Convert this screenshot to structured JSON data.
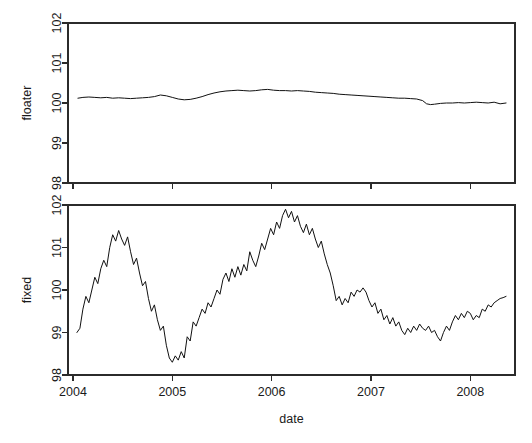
{
  "figure": {
    "width": 532,
    "height": 443,
    "background": "#ffffff",
    "line_color": "#111111",
    "axis_color": "#2b2b2b"
  },
  "chart_data": [
    {
      "type": "line",
      "title": "",
      "panel": "top",
      "xlabel": "",
      "ylabel": "floater",
      "xlim": [
        2003.95,
        2008.45
      ],
      "ylim": [
        98,
        102
      ],
      "xticks": [
        2004,
        2005,
        2006,
        2007,
        2008
      ],
      "xticklabels": [
        "2004",
        "2005",
        "2006",
        "2007",
        "2008"
      ],
      "yticks": [
        98,
        99,
        100,
        101,
        102
      ],
      "yticklabels": [
        "98",
        "99",
        "100",
        "101",
        "102"
      ],
      "grid": false,
      "legend": null,
      "series": [
        {
          "name": "floater",
          "x": [
            2004.05,
            2004.1,
            2004.16,
            2004.22,
            2004.28,
            2004.34,
            2004.4,
            2004.46,
            2004.52,
            2004.58,
            2004.64,
            2004.7,
            2004.76,
            2004.82,
            2004.88,
            2004.94,
            2005.0,
            2005.06,
            2005.12,
            2005.18,
            2005.24,
            2005.3,
            2005.36,
            2005.42,
            2005.48,
            2005.54,
            2005.6,
            2005.66,
            2005.72,
            2005.78,
            2005.84,
            2005.9,
            2005.96,
            2006.02,
            2006.08,
            2006.14,
            2006.2,
            2006.26,
            2006.32,
            2006.38,
            2006.44,
            2006.5,
            2006.56,
            2006.62,
            2006.68,
            2006.74,
            2006.8,
            2006.86,
            2006.92,
            2006.98,
            2007.04,
            2007.1,
            2007.16,
            2007.22,
            2007.28,
            2007.34,
            2007.4,
            2007.46,
            2007.52,
            2007.56,
            2007.6,
            2007.64,
            2007.7,
            2007.76,
            2007.82,
            2007.88,
            2007.94,
            2008.0,
            2008.06,
            2008.12,
            2008.18,
            2008.24,
            2008.3,
            2008.36
          ],
          "y": [
            100.12,
            100.14,
            100.15,
            100.14,
            100.13,
            100.14,
            100.12,
            100.13,
            100.12,
            100.11,
            100.12,
            100.13,
            100.14,
            100.16,
            100.2,
            100.18,
            100.14,
            100.1,
            100.08,
            100.09,
            100.12,
            100.16,
            100.21,
            100.25,
            100.28,
            100.3,
            100.31,
            100.32,
            100.31,
            100.3,
            100.31,
            100.33,
            100.34,
            100.32,
            100.31,
            100.31,
            100.3,
            100.31,
            100.3,
            100.29,
            100.27,
            100.26,
            100.25,
            100.24,
            100.22,
            100.21,
            100.2,
            100.19,
            100.18,
            100.17,
            100.16,
            100.15,
            100.14,
            100.13,
            100.12,
            100.12,
            100.11,
            100.1,
            100.06,
            99.98,
            99.96,
            99.97,
            99.99,
            100.0,
            100.0,
            100.01,
            100.0,
            100.01,
            100.02,
            100.01,
            100.0,
            100.02,
            99.98,
            100.0
          ]
        }
      ]
    },
    {
      "type": "line",
      "title": "",
      "panel": "bottom",
      "xlabel": "date",
      "ylabel": "fixed",
      "xlim": [
        2003.95,
        2008.45
      ],
      "ylim": [
        98,
        102
      ],
      "xticks": [
        2004,
        2005,
        2006,
        2007,
        2008
      ],
      "xticklabels": [
        "2004",
        "2005",
        "2006",
        "2007",
        "2008"
      ],
      "yticks": [
        98,
        99,
        100,
        101,
        102
      ],
      "yticklabels": [
        "98",
        "99",
        "100",
        "101",
        "102"
      ],
      "grid": false,
      "legend": null,
      "series": [
        {
          "name": "fixed",
          "x": [
            2004.04,
            2004.07,
            2004.1,
            2004.13,
            2004.16,
            2004.19,
            2004.22,
            2004.25,
            2004.28,
            2004.31,
            2004.34,
            2004.37,
            2004.4,
            2004.43,
            2004.46,
            2004.49,
            2004.52,
            2004.55,
            2004.58,
            2004.61,
            2004.64,
            2004.67,
            2004.7,
            2004.73,
            2004.76,
            2004.79,
            2004.82,
            2004.85,
            2004.88,
            2004.91,
            2004.94,
            2004.97,
            2005.0,
            2005.03,
            2005.06,
            2005.09,
            2005.12,
            2005.15,
            2005.18,
            2005.21,
            2005.24,
            2005.27,
            2005.3,
            2005.33,
            2005.36,
            2005.39,
            2005.42,
            2005.45,
            2005.48,
            2005.51,
            2005.54,
            2005.57,
            2005.6,
            2005.63,
            2005.66,
            2005.69,
            2005.72,
            2005.75,
            2005.78,
            2005.81,
            2005.84,
            2005.87,
            2005.9,
            2005.93,
            2005.96,
            2005.99,
            2006.02,
            2006.05,
            2006.08,
            2006.11,
            2006.14,
            2006.17,
            2006.2,
            2006.23,
            2006.26,
            2006.29,
            2006.32,
            2006.35,
            2006.38,
            2006.41,
            2006.44,
            2006.47,
            2006.5,
            2006.53,
            2006.56,
            2006.59,
            2006.62,
            2006.65,
            2006.68,
            2006.71,
            2006.74,
            2006.77,
            2006.8,
            2006.83,
            2006.86,
            2006.89,
            2006.92,
            2006.95,
            2006.98,
            2007.01,
            2007.04,
            2007.07,
            2007.1,
            2007.13,
            2007.16,
            2007.19,
            2007.22,
            2007.25,
            2007.28,
            2007.31,
            2007.34,
            2007.37,
            2007.4,
            2007.43,
            2007.46,
            2007.49,
            2007.52,
            2007.55,
            2007.58,
            2007.61,
            2007.64,
            2007.67,
            2007.7,
            2007.73,
            2007.76,
            2007.79,
            2007.82,
            2007.85,
            2007.88,
            2007.91,
            2007.94,
            2007.97,
            2008.0,
            2008.03,
            2008.06,
            2008.09,
            2008.12,
            2008.15,
            2008.18,
            2008.21,
            2008.24,
            2008.27,
            2008.3,
            2008.33,
            2008.36
          ],
          "y": [
            99.0,
            99.1,
            99.55,
            99.85,
            99.7,
            100.0,
            100.3,
            100.15,
            100.5,
            100.7,
            100.55,
            101.0,
            101.3,
            101.15,
            101.4,
            101.2,
            101.05,
            101.25,
            100.9,
            100.6,
            100.75,
            100.4,
            100.1,
            100.2,
            99.8,
            99.5,
            99.65,
            99.3,
            99.05,
            99.15,
            98.7,
            98.4,
            98.3,
            98.45,
            98.35,
            98.55,
            98.4,
            98.9,
            98.8,
            99.25,
            99.15,
            99.35,
            99.55,
            99.45,
            99.7,
            99.6,
            99.8,
            100.0,
            99.9,
            100.25,
            100.4,
            100.2,
            100.5,
            100.3,
            100.55,
            100.35,
            100.6,
            100.45,
            100.9,
            100.7,
            100.55,
            100.8,
            101.1,
            100.95,
            101.2,
            101.45,
            101.3,
            101.6,
            101.45,
            101.75,
            101.9,
            101.7,
            101.85,
            101.6,
            101.75,
            101.5,
            101.35,
            101.55,
            101.3,
            101.45,
            101.2,
            101.0,
            101.15,
            100.85,
            100.6,
            100.4,
            100.1,
            99.75,
            99.85,
            99.65,
            99.8,
            99.7,
            99.95,
            99.85,
            100.0,
            99.95,
            100.05,
            99.95,
            99.75,
            99.6,
            99.7,
            99.45,
            99.55,
            99.3,
            99.4,
            99.2,
            99.35,
            99.15,
            99.25,
            99.05,
            98.95,
            99.1,
            99.0,
            99.15,
            99.05,
            99.2,
            99.1,
            99.05,
            99.15,
            99.0,
            99.05,
            98.9,
            98.8,
            99.0,
            99.15,
            99.05,
            99.25,
            99.4,
            99.3,
            99.45,
            99.35,
            99.5,
            99.45,
            99.3,
            99.4,
            99.35,
            99.55,
            99.5,
            99.65,
            99.6,
            99.7,
            99.75,
            99.8,
            99.82,
            99.85
          ]
        }
      ]
    }
  ]
}
